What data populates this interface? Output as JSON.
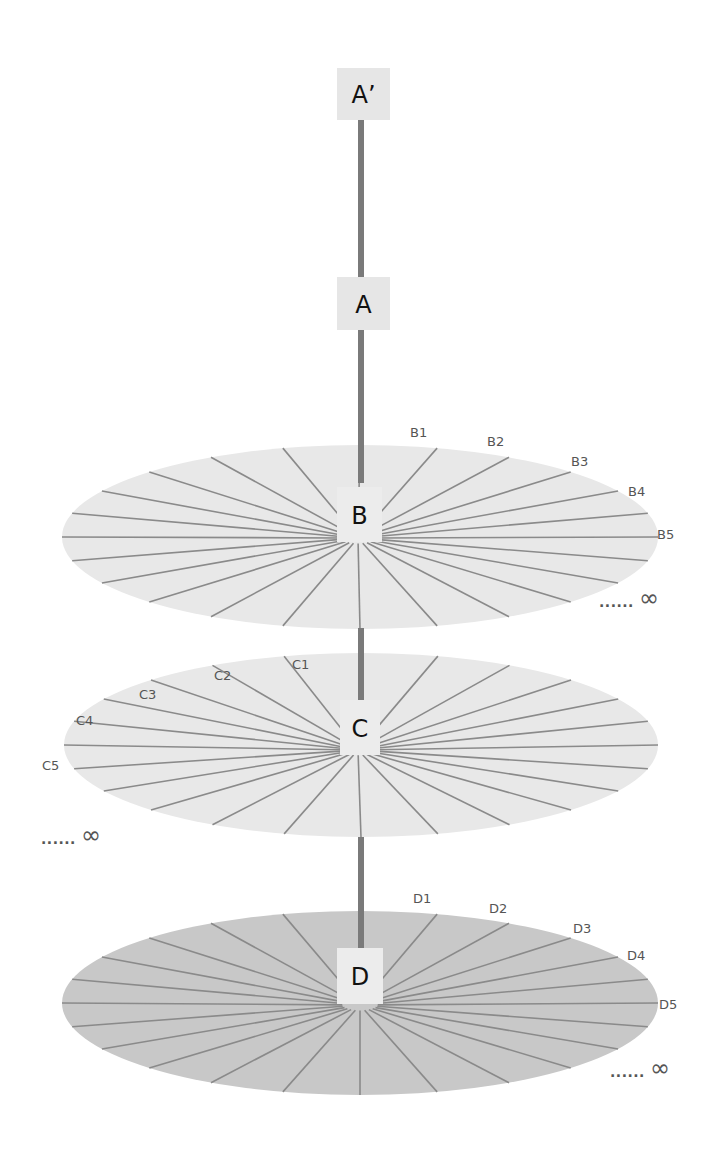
{
  "diagram": {
    "axis": {
      "x": 361,
      "color": "#7a7a7a",
      "width": 6,
      "segments": [
        {
          "from": 118,
          "to": 277
        },
        {
          "from": 330,
          "to": 483
        },
        {
          "from": 628,
          "to": 713
        },
        {
          "from": 837,
          "to": 975
        }
      ]
    },
    "nodes": [
      {
        "id": "A-prime",
        "label": "A’",
        "x": 337,
        "y": 68,
        "w": 53,
        "h": 52,
        "fill": "#e6e6e6"
      },
      {
        "id": "A",
        "label": "A",
        "x": 337,
        "y": 277,
        "w": 53,
        "h": 53,
        "fill": "#e6e6e6"
      },
      {
        "id": "B",
        "label": "B",
        "x": 337,
        "y": 487,
        "w": 45,
        "h": 55,
        "fill": "#ececec"
      },
      {
        "id": "C",
        "label": "C",
        "x": 340,
        "y": 700,
        "w": 40,
        "h": 55,
        "fill": "#ececec"
      },
      {
        "id": "D",
        "label": "D",
        "x": 337,
        "y": 948,
        "w": 46,
        "h": 56,
        "fill": "#ececec"
      }
    ],
    "discs": [
      {
        "id": "B",
        "cx": 360,
        "cy": 537,
        "rx": 298,
        "ry": 92,
        "fill": "#e8e8e8",
        "spoke_color": "#8a8a8a",
        "hub": {
          "x": 358,
          "y": 538
        },
        "spoke_count": 24,
        "labels": [
          {
            "text": "B1",
            "x": 410,
            "y": 437
          },
          {
            "text": "B2",
            "x": 487,
            "y": 446
          },
          {
            "text": "B3",
            "x": 571,
            "y": 466
          },
          {
            "text": "B4",
            "x": 628,
            "y": 496
          },
          {
            "text": "B5",
            "x": 657,
            "y": 539
          }
        ],
        "infinity": {
          "dots": "......",
          "symbol": "∞",
          "x": 599,
          "y": 607
        }
      },
      {
        "id": "C",
        "cx": 361,
        "cy": 745,
        "rx": 297,
        "ry": 92,
        "fill": "#e8e8e8",
        "spoke_color": "#8a8a8a",
        "hub": {
          "x": 358,
          "y": 750
        },
        "spoke_count": 24,
        "labels": [
          {
            "text": "C1",
            "x": 292,
            "y": 669
          },
          {
            "text": "C2",
            "x": 214,
            "y": 680
          },
          {
            "text": "C3",
            "x": 139,
            "y": 699
          },
          {
            "text": "C4",
            "x": 76,
            "y": 725
          },
          {
            "text": "C5",
            "x": 42,
            "y": 770
          }
        ],
        "infinity": {
          "dots": "......",
          "symbol": "∞",
          "x": 41,
          "y": 844
        }
      },
      {
        "id": "D",
        "cx": 360,
        "cy": 1003,
        "rx": 298,
        "ry": 92,
        "fill": "#c8c8c8",
        "spoke_color": "#8a8a8a",
        "hub": {
          "x": 360,
          "y": 1005
        },
        "spoke_count": 24,
        "labels": [
          {
            "text": "D1",
            "x": 413,
            "y": 903
          },
          {
            "text": "D2",
            "x": 489,
            "y": 913
          },
          {
            "text": "D3",
            "x": 573,
            "y": 933
          },
          {
            "text": "D4",
            "x": 627,
            "y": 960
          },
          {
            "text": "D5",
            "x": 659,
            "y": 1009
          }
        ],
        "infinity": {
          "dots": "......",
          "symbol": "∞",
          "x": 610,
          "y": 1077
        }
      }
    ]
  }
}
